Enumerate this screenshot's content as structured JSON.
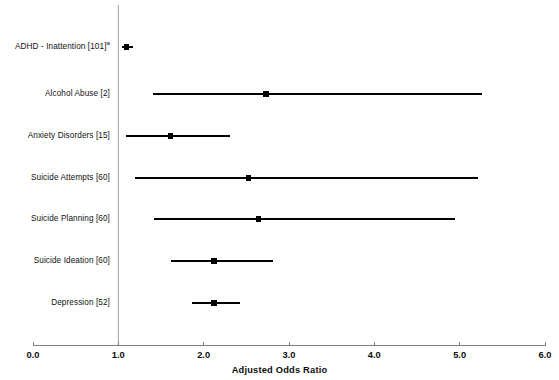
{
  "chart_data": {
    "type": "scatter",
    "subtype": "forest-plot",
    "title": "",
    "xlabel": "Adjusted Odds Ratio",
    "ylabel": "",
    "xlim": [
      0.0,
      6.0
    ],
    "xticks": [
      "0.0",
      "1.0",
      "2.0",
      "3.0",
      "4.0",
      "5.0",
      "6.0"
    ],
    "xtick_values": [
      0.0,
      1.0,
      2.0,
      3.0,
      4.0,
      5.0,
      6.0
    ],
    "grid": false,
    "legend": "none",
    "reference_line": 1.0,
    "categories": [
      "ADHD - Inattention [101]",
      "Alcohol Abuse [2]",
      "Anxiety Disorders [15]",
      "Suicide Attempts [60]",
      "Suicide Planning [60]",
      "Suicide Ideation [60]",
      "Depression [52]"
    ],
    "points": [
      {
        "label": "ADHD - Inattention [101]",
        "label_superscript": "a",
        "reference_numbers": "101",
        "odds_ratio": 1.1,
        "ci_low": 1.04,
        "ci_high": 1.17
      },
      {
        "label": "Alcohol Abuse [2]",
        "label_superscript": "",
        "reference_numbers": "2",
        "odds_ratio": 2.73,
        "ci_low": 1.41,
        "ci_high": 5.26
      },
      {
        "label": "Anxiety Disorders [15]",
        "label_superscript": "",
        "reference_numbers": "15",
        "odds_ratio": 1.61,
        "ci_low": 1.09,
        "ci_high": 2.31
      },
      {
        "label": "Suicide Attempts [60]",
        "label_superscript": "",
        "reference_numbers": "60",
        "odds_ratio": 2.53,
        "ci_low": 1.2,
        "ci_high": 5.22
      },
      {
        "label": "Suicide Planning [60]",
        "label_superscript": "",
        "reference_numbers": "60",
        "odds_ratio": 2.64,
        "ci_low": 1.42,
        "ci_high": 4.95
      },
      {
        "label": "Suicide Ideation [60]",
        "label_superscript": "",
        "reference_numbers": "60",
        "odds_ratio": 2.12,
        "ci_low": 1.62,
        "ci_high": 2.81
      },
      {
        "label": "Depression [52]",
        "label_superscript": "",
        "reference_numbers": "52",
        "odds_ratio": 2.12,
        "ci_low": 1.86,
        "ci_high": 2.42
      }
    ],
    "colors": {
      "marker": "#000000",
      "whisker": "#000000",
      "axis": "#808080",
      "reference_line": "#a0a0a0",
      "text": "#111111",
      "background": "#ffffff"
    }
  }
}
